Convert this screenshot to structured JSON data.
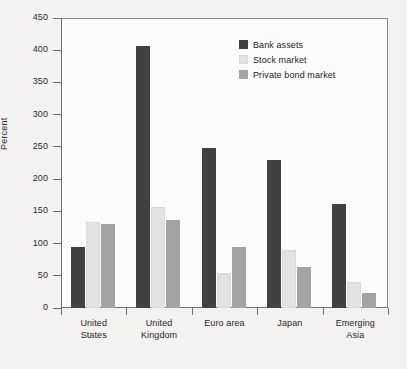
{
  "chart_data": {
    "type": "bar",
    "title": "",
    "subtitle": "",
    "xlabel": "",
    "ylabel": "Percent",
    "ylim": [
      0,
      450
    ],
    "ytick_step": 50,
    "yticks": [
      0,
      50,
      100,
      150,
      200,
      250,
      300,
      350,
      400,
      450
    ],
    "ytick_labels": [
      "0",
      "50",
      "100",
      "150",
      "200",
      "250",
      "300",
      "350",
      "400",
      "450"
    ],
    "grid": false,
    "legend_position": "upper-right-inside",
    "categories": [
      "United States",
      "United Kingdom",
      "Euro area",
      "Japan",
      "Emerging Asia"
    ],
    "category_lines": [
      [
        "United",
        "States"
      ],
      [
        "United",
        "Kingdom"
      ],
      [
        "Euro area"
      ],
      [
        "Japan"
      ],
      [
        "Emerging",
        "Asia"
      ]
    ],
    "series": [
      {
        "name": "Bank assets",
        "color": "#414141",
        "values": [
          95,
          406,
          249,
          230,
          161
        ]
      },
      {
        "name": "Stock market",
        "color": "#e2e2e2",
        "values": [
          133,
          157,
          55,
          90,
          40
        ]
      },
      {
        "name": "Private bond market",
        "color": "#a3a3a3",
        "values": [
          131,
          137,
          95,
          63,
          24
        ]
      }
    ]
  },
  "figure": {
    "page_background": "#f3f2f1",
    "plot_background": "#fbfbfb",
    "axis_color": "#6d6d6d",
    "frame_color": "#8a8a8a",
    "text_color": "#1f1f1f"
  }
}
